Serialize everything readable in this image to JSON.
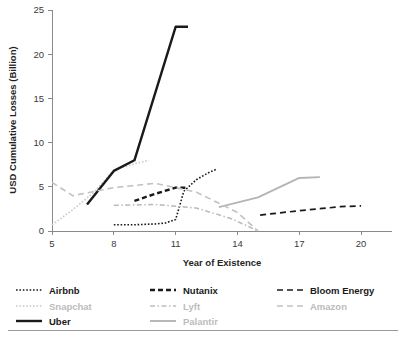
{
  "chart_data": {
    "type": "line",
    "title": "",
    "xlabel": "Year of Existence",
    "ylabel": "USD Cumulative Losses (Billion)",
    "xlim": [
      5,
      21.5
    ],
    "ylim": [
      0,
      25
    ],
    "xticks": [
      5,
      8,
      11,
      14,
      17,
      20
    ],
    "yticks": [
      0,
      5,
      10,
      15,
      20,
      25
    ],
    "xtick_labels": [
      "5",
      "8",
      "11",
      "14",
      "17",
      "20"
    ],
    "ytick_labels": [
      "0",
      "5",
      "10",
      "15",
      "20",
      "25"
    ],
    "grid": false,
    "legend_position": "below",
    "series": [
      {
        "name": "Airbnb",
        "color": "#1a1a1a",
        "style": "dotted",
        "width": 1.6,
        "dash": "1.6,1.8",
        "x": [
          8,
          9,
          10,
          10.5,
          11,
          11.4,
          12,
          12.6,
          13
        ],
        "y": [
          0.7,
          0.7,
          0.8,
          0.9,
          1.3,
          4.5,
          5.8,
          6.6,
          7.0
        ]
      },
      {
        "name": "Snapchat",
        "color": "#c9c9c9",
        "style": "dotted",
        "width": 1.6,
        "dash": "1.6,1.8",
        "x": [
          5,
          6,
          7,
          8,
          9,
          9.7
        ],
        "y": [
          0.7,
          2.4,
          4.3,
          6.9,
          7.6,
          8.0
        ]
      },
      {
        "name": "Uber",
        "color": "#1a1a1a",
        "style": "solid",
        "width": 2.4,
        "dash": "",
        "x": [
          6.7,
          8,
          9,
          11,
          11.6
        ],
        "y": [
          3.0,
          6.8,
          8.0,
          23.1,
          23.1
        ]
      },
      {
        "name": "Nutanix",
        "color": "#1a1a1a",
        "style": "dashed",
        "width": 2.4,
        "dash": "5,3",
        "x": [
          9,
          10,
          11,
          11.6
        ],
        "y": [
          3.4,
          4.2,
          4.9,
          4.9
        ]
      },
      {
        "name": "Lyft",
        "color": "#bdbdbd",
        "style": "dashdot",
        "width": 1.6,
        "dash": "5,2.5,1.5,2.5",
        "x": [
          8,
          10,
          12,
          13.7,
          15
        ],
        "y": [
          2.9,
          3.0,
          2.6,
          1.4,
          0.0
        ]
      },
      {
        "name": "Palantir",
        "color": "#b5b5b5",
        "style": "solid",
        "width": 1.9,
        "dash": "",
        "x": [
          13.1,
          15,
          17,
          18
        ],
        "y": [
          2.7,
          3.8,
          6.0,
          6.1
        ]
      },
      {
        "name": "Bloom Energy",
        "color": "#1a1a1a",
        "style": "dashed",
        "width": 1.7,
        "dash": "6,4",
        "x": [
          15.1,
          17,
          19,
          20
        ],
        "y": [
          1.8,
          2.3,
          2.75,
          2.85
        ]
      },
      {
        "name": "Amazon",
        "color": "#c2c2c2",
        "style": "dashed",
        "width": 1.6,
        "dash": "6,4",
        "x": [
          5,
          6,
          8,
          10,
          12,
          14,
          15
        ],
        "y": [
          5.5,
          4.0,
          4.9,
          5.4,
          4.4,
          2.1,
          0.0
        ]
      }
    ],
    "legend": [
      {
        "name": "Airbnb",
        "color": "#1a1a1a",
        "dash": "1.6,1.8",
        "width": 1.6,
        "dim": false
      },
      {
        "name": "Nutanix",
        "color": "#1a1a1a",
        "dash": "5,3",
        "width": 2.4,
        "dim": false
      },
      {
        "name": "Bloom Energy",
        "color": "#1a1a1a",
        "dash": "6,4",
        "width": 1.7,
        "dim": false
      },
      {
        "name": "Snapchat",
        "color": "#c9c9c9",
        "dash": "1.6,1.8",
        "width": 1.6,
        "dim": true
      },
      {
        "name": "Lyft",
        "color": "#bdbdbd",
        "dash": "5,2.5,1.5,2.5",
        "width": 1.6,
        "dim": true
      },
      {
        "name": "Amazon",
        "color": "#c2c2c2",
        "dash": "6,4",
        "width": 1.6,
        "dim": true
      },
      {
        "name": "Uber",
        "color": "#1a1a1a",
        "dash": "",
        "width": 2.4,
        "dim": false
      },
      {
        "name": "Palantir",
        "color": "#b5b5b5",
        "dash": "",
        "width": 1.9,
        "dim": true
      }
    ]
  }
}
